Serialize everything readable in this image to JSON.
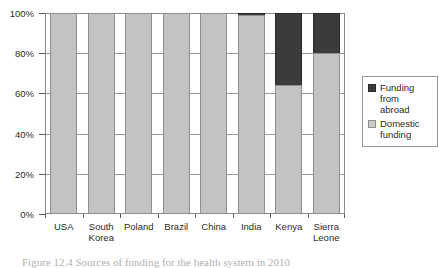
{
  "chart_data": {
    "type": "bar",
    "subtype": "100% stacked bar",
    "title": "",
    "xlabel": "",
    "ylabel": "",
    "ylim": [
      0,
      100
    ],
    "yticks": [
      "0%",
      "20%",
      "40%",
      "60%",
      "80%",
      "100%"
    ],
    "ytick_values": [
      0,
      20,
      40,
      60,
      80,
      100
    ],
    "grid": true,
    "grid_axis": "y",
    "legend_position": "right",
    "categories": [
      "USA",
      "South Korea",
      "Poland",
      "Brazil",
      "China",
      "India",
      "Kenya",
      "Sierra Leone"
    ],
    "category_lines": [
      [
        "USA"
      ],
      [
        "South",
        "Korea"
      ],
      [
        "Poland"
      ],
      [
        "Brazil"
      ],
      [
        "China"
      ],
      [
        "India"
      ],
      [
        "Kenya"
      ],
      [
        "Sierra",
        "Leone"
      ]
    ],
    "series": [
      {
        "name": "Domestic funding",
        "color": "#c3c3c3",
        "values": [
          100,
          100,
          100,
          100,
          100,
          99,
          64,
          80
        ]
      },
      {
        "name": "Funding from abroad",
        "color": "#3b3b3b",
        "values": [
          0,
          0,
          0,
          0,
          0,
          1,
          36,
          20
        ]
      }
    ],
    "stack_order": [
      "Domestic funding",
      "Funding from abroad"
    ]
  },
  "legend": {
    "entries": [
      {
        "label_lines": [
          "Funding",
          "from",
          "abroad"
        ],
        "swatch": "dark-swatch"
      },
      {
        "label_lines": [
          "Domestic",
          "funding"
        ],
        "swatch": "light-swatch"
      }
    ]
  },
  "caption": {
    "text": "Figure 12.4 Sources of funding for the health system in 2010"
  },
  "colors": {
    "domestic": "#c3c3c3",
    "abroad": "#3b3b3b",
    "axis": "#5a5a5a",
    "grid": "#9a9a9a",
    "text": "#2b2b2b"
  }
}
